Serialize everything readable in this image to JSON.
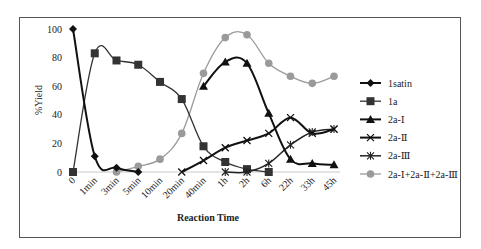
{
  "chart_data": {
    "type": "line",
    "title": "",
    "xlabel": "Reaction Time",
    "ylabel": "%Yield",
    "ylim": [
      0,
      100
    ],
    "yticks": [
      0,
      20,
      40,
      60,
      80,
      100
    ],
    "grid": false,
    "legend_position": "right",
    "categories": [
      "0",
      "1min",
      "3min",
      "5min",
      "10min",
      "20min",
      "40min",
      "1h",
      "2h",
      "6h",
      "22h",
      "33h",
      "45h"
    ],
    "series": [
      {
        "name": "1satin",
        "marker": "diamond",
        "color": "#111111",
        "width": 2,
        "values": [
          100,
          11,
          3,
          0,
          null,
          null,
          null,
          null,
          null,
          null,
          null,
          null,
          null
        ]
      },
      {
        "name": "1a",
        "marker": "square",
        "color": "#333333",
        "width": 1.3,
        "values": [
          0,
          83,
          78,
          75,
          63,
          51,
          18,
          7,
          2,
          0,
          null,
          null,
          null
        ]
      },
      {
        "name": "2a-Ⅰ",
        "marker": "triangle",
        "color": "#111111",
        "width": 2,
        "values": [
          null,
          null,
          null,
          null,
          null,
          null,
          60,
          77,
          76,
          41,
          9,
          6,
          5
        ]
      },
      {
        "name": "2a-Ⅱ",
        "marker": "cross",
        "color": "#111111",
        "width": 2,
        "values": [
          null,
          null,
          null,
          null,
          null,
          0,
          8,
          17,
          22,
          27,
          38,
          27,
          30
        ]
      },
      {
        "name": "2a-Ⅲ",
        "marker": "star",
        "color": "#222222",
        "width": 1.5,
        "values": [
          null,
          null,
          null,
          null,
          null,
          null,
          null,
          0,
          0,
          6,
          19,
          28,
          30
        ]
      },
      {
        "name": "2a-Ⅰ+2a-Ⅱ+2a-Ⅲ",
        "marker": "circle",
        "color": "#9a9a9a",
        "width": 1.3,
        "values": [
          null,
          null,
          0,
          4,
          9,
          27,
          69,
          94,
          96,
          76,
          67,
          62,
          67
        ]
      }
    ]
  }
}
